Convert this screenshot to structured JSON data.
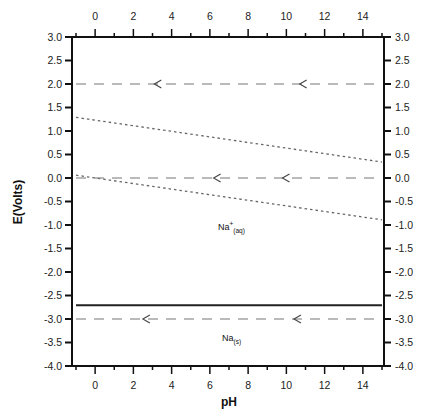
{
  "chart_data": {
    "type": "line",
    "title": "",
    "xlabel": "pH",
    "ylabel": "E(Volts)",
    "xlim": [
      -1,
      15
    ],
    "ylim": [
      -4.0,
      3.0
    ],
    "x_ticks": [
      0,
      2,
      4,
      6,
      8,
      10,
      12,
      14
    ],
    "x_tick_labels": [
      "0",
      "2",
      "4",
      "6",
      "8",
      "10",
      "12",
      "14"
    ],
    "y_ticks": [
      3.0,
      2.5,
      2.0,
      1.5,
      1.0,
      0.5,
      0.0,
      -0.5,
      -1.0,
      -1.5,
      -2.0,
      -2.5,
      -3.0,
      -3.5,
      -4.0
    ],
    "y_tick_labels": [
      "3.0",
      "2.5",
      "2.0",
      "1.5",
      "1.0",
      "0.5",
      "0.0",
      "-0.5",
      "-1.0",
      "-1.5",
      "-2.0",
      "-2.5",
      "-3.0",
      "-3.5",
      "-4.0"
    ],
    "grid": false,
    "mirror_axes": true,
    "series": [
      {
        "name": "O2/H2O water stability (upper)",
        "style": "dotted",
        "x": [
          -1,
          15
        ],
        "y": [
          1.29,
          0.34
        ]
      },
      {
        "name": "H+/H2 water stability (lower)",
        "style": "dotted",
        "x": [
          -1,
          15
        ],
        "y": [
          0.06,
          -0.89
        ]
      },
      {
        "name": "Na+/Na boundary",
        "style": "solid",
        "x": [
          -1,
          15
        ],
        "y": [
          -2.71,
          -2.71
        ]
      },
      {
        "name": "dashed reference 2.0 V",
        "style": "dashed",
        "x": [
          -1,
          15
        ],
        "y": [
          2.0,
          2.0
        ],
        "arrows_at_pH": [
          3.2,
          10.8
        ]
      },
      {
        "name": "dashed reference 0.0 V",
        "style": "dashed",
        "x": [
          -1,
          15
        ],
        "y": [
          0.0,
          0.0
        ],
        "arrows_at_pH": [
          6.3,
          9.9
        ]
      },
      {
        "name": "dashed reference -3.0 V",
        "style": "dashed",
        "x": [
          -1,
          15
        ],
        "y": [
          -3.0,
          -3.0
        ],
        "arrows_at_pH": [
          2.6,
          10.5
        ]
      }
    ],
    "annotations": [
      {
        "text": "Na",
        "sup": "+",
        "sub": "(aq)",
        "x": 7.5,
        "y": -1.1
      },
      {
        "text": "Na",
        "sup": "",
        "sub": "(s)",
        "x": 7.5,
        "y": -3.45
      }
    ]
  },
  "labels": {
    "xlabel": "pH",
    "ylabel": "E(Volts)",
    "na_aq_main": "Na",
    "na_aq_sup": "+",
    "na_aq_sub": "(aq)",
    "na_s_main": "Na",
    "na_s_sub": "(s)"
  },
  "colors": {
    "axis": "#111111",
    "solid_line": "#222222",
    "dashed_line": "#777777",
    "dotted_line": "#666666"
  }
}
